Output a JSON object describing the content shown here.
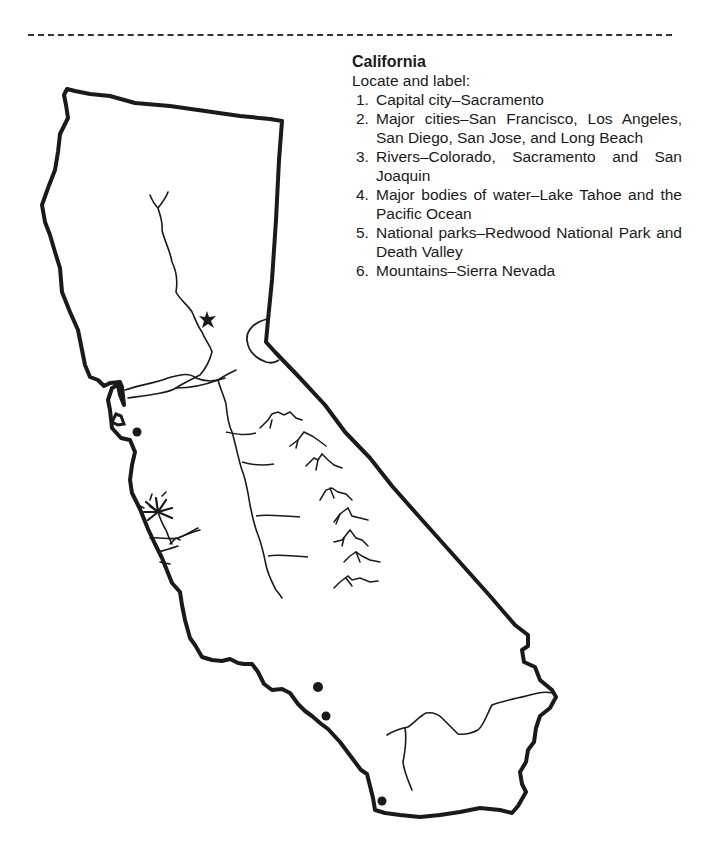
{
  "worksheet": {
    "title": "California",
    "prompt": "Locate and label:",
    "items": [
      {
        "num": "1.",
        "text": "Capital city–Sacramento"
      },
      {
        "num": "2.",
        "text": "Major cities–San Francisco, Los Angeles, San Diego, San Jose, and Long Beach"
      },
      {
        "num": "3.",
        "text": "Rivers–Colorado, Sacramento and San Joaquin"
      },
      {
        "num": "4.",
        "text": "Major bodies of water–Lake Tahoe and the Pacific Ocean"
      },
      {
        "num": "5.",
        "text": "National parks–Redwood National Park and Death Valley"
      },
      {
        "num": "6.",
        "text": "Mountains–Sierra Nevada"
      }
    ]
  },
  "map": {
    "region": "California",
    "outline_color": "#1a1a1a",
    "symbols": [
      {
        "type": "star",
        "meaning": "capital-city"
      },
      {
        "type": "dot",
        "meaning": "city",
        "count": 5
      },
      {
        "type": "palm-tree",
        "meaning": "decorative"
      },
      {
        "type": "mountain-range",
        "meaning": "sierra-nevada",
        "count": 8
      },
      {
        "type": "river",
        "meaning": "rivers"
      },
      {
        "type": "lake",
        "meaning": "lake-tahoe"
      }
    ]
  }
}
